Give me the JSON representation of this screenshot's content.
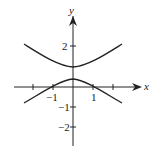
{
  "figure": {
    "x_axis_label": "x",
    "y_axis_label": "y",
    "x_ticks": [
      {
        "value": -2,
        "label": ""
      },
      {
        "value": -1,
        "label": "−1"
      },
      {
        "value": 1,
        "label": "1"
      },
      {
        "value": 2,
        "label": ""
      }
    ],
    "y_ticks": [
      {
        "value": 2,
        "label": "2"
      },
      {
        "value": -1,
        "label": "−1"
      },
      {
        "value": -2,
        "label": "−2"
      }
    ],
    "curve": "hyperbola with vertical transverse axis",
    "upper_branch_vertex": [
      0,
      1
    ],
    "lower_branch_vertex": [
      0,
      0.4
    ],
    "lower_branch_x_intercepts": [
      -1,
      1
    ],
    "stroke_color": "#222222"
  }
}
